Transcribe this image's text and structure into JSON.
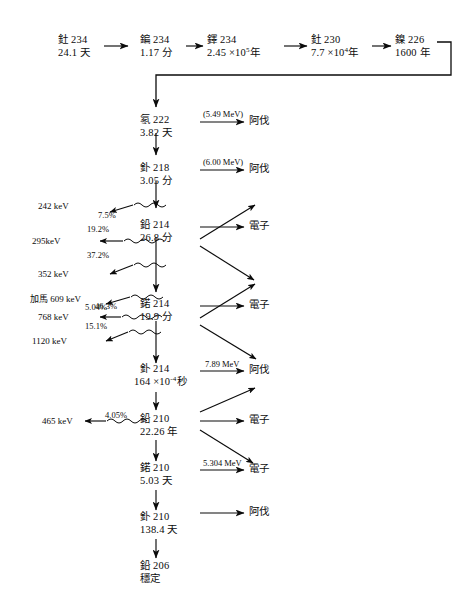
{
  "diagram": {
    "units": {
      "day": "天",
      "minute": "分",
      "year": "年",
      "second": "秒"
    },
    "particles": {
      "alpha": "阿伐",
      "beta": "電子",
      "gamma": "加馬"
    },
    "top_chain": [
      {
        "id": "th234",
        "name": "釷 234",
        "halflife": "24.1 天"
      },
      {
        "id": "pa234",
        "name": "鍽 234",
        "halflife": "1.17 分"
      },
      {
        "id": "u234",
        "name": "鐸 234",
        "halflife_pre": "2.45 ×10",
        "halflife_exp": "5",
        "halflife_post": "年"
      },
      {
        "id": "th230",
        "name": "釷 230",
        "halflife_pre": "7.7 ×10",
        "halflife_exp": "4",
        "halflife_post": "年"
      },
      {
        "id": "ra226",
        "name": "鎳 226",
        "halflife": "1600 年"
      }
    ],
    "main_chain": [
      {
        "id": "rn222",
        "name": "氡 222",
        "halflife": "3.82 天"
      },
      {
        "id": "po218",
        "name": "釙 218",
        "halflife": "3.05 分"
      },
      {
        "id": "pb214",
        "name": "鉛 214",
        "halflife": "26.8 分"
      },
      {
        "id": "bi214",
        "name": "鍩 214",
        "halflife": "19.9 分"
      },
      {
        "id": "po214",
        "name": "釙 214",
        "halflife_pre": "164 ×10",
        "halflife_exp": "-4",
        "halflife_post": "秒"
      },
      {
        "id": "pb210",
        "name": "鉛 210",
        "halflife": "22.26 年"
      },
      {
        "id": "bi210",
        "name": "鍩 210",
        "halflife": "5.03 天"
      },
      {
        "id": "po210",
        "name": "釙 210",
        "halflife": "138.4 天"
      },
      {
        "id": "pb206",
        "name": "鉛 206",
        "halflife": "穩定"
      }
    ],
    "emissions": [
      {
        "id": "rn222-alpha",
        "energy": "(5.49 MeV)",
        "particle": "阿伐"
      },
      {
        "id": "po218-alpha",
        "energy": "(6.00 MeV)",
        "particle": "阿伐"
      },
      {
        "id": "pb214-beta",
        "energy": "",
        "particle": "電子"
      },
      {
        "id": "bi214-beta",
        "energy": "",
        "particle": "電子"
      },
      {
        "id": "po214-alpha",
        "energy": "7.89 MeV",
        "particle": "阿伐"
      },
      {
        "id": "pb210-beta",
        "energy": "",
        "particle": "電子"
      },
      {
        "id": "bi210-beta",
        "energy": "5.304 MeV",
        "particle": "電子"
      },
      {
        "id": "po210-alpha",
        "energy": "",
        "particle": "阿伐"
      }
    ],
    "gamma_lines": [
      {
        "id": "g242",
        "energy": "242 keV",
        "intensity": "7.5%"
      },
      {
        "id": "g295",
        "energy": "295keV",
        "intensity": "19.2%"
      },
      {
        "id": "g352",
        "energy": "352 keV",
        "intensity": "37.2%"
      },
      {
        "id": "g609",
        "energy": "加馬 609 keV",
        "intensity": "46.3%"
      },
      {
        "id": "g768",
        "energy": "768 keV",
        "intensity": "5.04%"
      },
      {
        "id": "g1120",
        "energy": "1120 keV",
        "intensity": "15.1%"
      },
      {
        "id": "g465",
        "energy": "465 keV",
        "intensity": "4.05%"
      }
    ],
    "colors": {
      "ink": "#0b0b0b",
      "background": "#ffffff"
    }
  }
}
